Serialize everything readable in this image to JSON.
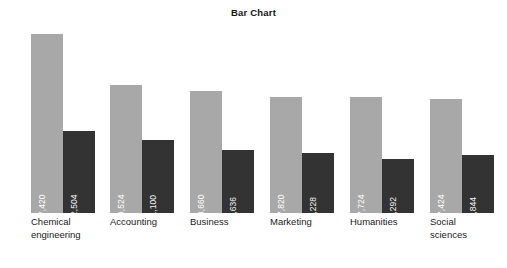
{
  "chart_data": {
    "type": "bar",
    "title": "Bar Chart",
    "xlabel": "",
    "ylabel": "",
    "grid": false,
    "legend": "none",
    "ylim": [
      0,
      28000
    ],
    "categories": [
      "Chemical engineering",
      "Accounting",
      "Business",
      "Marketing",
      "Humanities",
      "Social sciences"
    ],
    "series": [
      {
        "name": "light-series",
        "color": "#a8a8a8",
        "values": [
          27420,
          19524,
          18660,
          17820,
          17724,
          17424
        ],
        "labels": [
          "$27,420",
          "$19,524",
          "$18,660",
          "$17,820",
          "$17,724",
          "$17,424"
        ]
      },
      {
        "name": "dark-series",
        "color": "#333333",
        "values": [
          12504,
          11100,
          9636,
          9228,
          8292,
          8844
        ],
        "labels": [
          "$12,504",
          "$11,100",
          "$9,636",
          "$9,228",
          "$8,292",
          "$8,844"
        ]
      }
    ],
    "category_label_lines": [
      "Chemical\nengineering",
      "Accounting",
      "Business",
      "Marketing",
      "Humanities",
      "Social\nsciences"
    ]
  }
}
